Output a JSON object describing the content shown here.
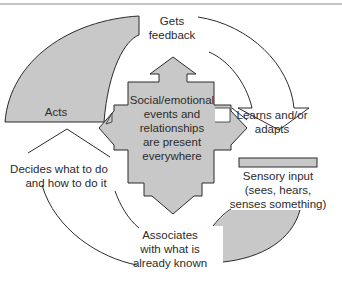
{
  "diagram": {
    "type": "cycle",
    "colors": {
      "shape_fill": "#c8c8c8",
      "stroke": "#2b2b2b",
      "rule": "#8a8a8a",
      "background": "#ffffff",
      "text": "#2b2b2b"
    },
    "center": {
      "lines": [
        "Social/emotional",
        "events and",
        "relationships",
        "are present",
        "everywhere"
      ]
    },
    "steps": [
      {
        "id": "gets-feedback",
        "lines": [
          "Gets",
          "feedback"
        ]
      },
      {
        "id": "learns-adapts",
        "lines": [
          "Learns and/or",
          "adapts"
        ]
      },
      {
        "id": "sensory-input",
        "lines": [
          "Sensory input",
          "(sees, hears,",
          "senses something)"
        ]
      },
      {
        "id": "associates",
        "lines": [
          "Associates",
          "with what is",
          "already known"
        ]
      },
      {
        "id": "decides",
        "lines": [
          "Decides what to do",
          "and how to do it"
        ]
      },
      {
        "id": "acts",
        "lines": [
          "Acts"
        ]
      }
    ]
  }
}
